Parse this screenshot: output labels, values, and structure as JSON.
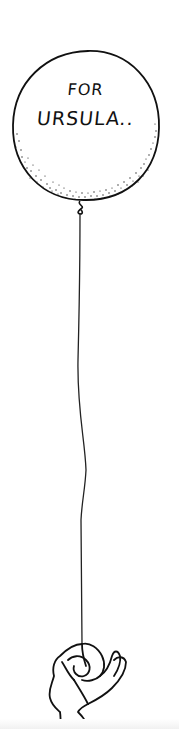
{
  "illustration": {
    "subject": "balloon held by a hand",
    "balloon_text": {
      "line1": "FOR",
      "line2": "URSULA.."
    },
    "colors": {
      "ink": "#111111",
      "background": "#ffffff"
    }
  }
}
